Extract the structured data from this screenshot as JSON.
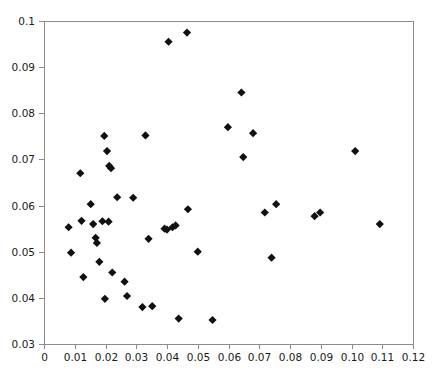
{
  "chart_data": {
    "type": "scatter",
    "title": "",
    "subtitle": "",
    "xlabel": "",
    "ylabel": "",
    "xlim": [
      0,
      0.12
    ],
    "ylim": [
      0.03,
      0.1
    ],
    "xticks": [
      0,
      0.01,
      0.02,
      0.03,
      0.04,
      0.05,
      0.06,
      0.07,
      0.08,
      0.09,
      0.1,
      0.11,
      0.12
    ],
    "xtick_labels": [
      "0",
      "0.01",
      "0.02",
      "0.03",
      "0.04",
      "0.05",
      "0.06",
      "0.07",
      "0.08",
      "0.09",
      "0.10",
      "0.11",
      "0.12"
    ],
    "yticks": [
      0.03,
      0.04,
      0.05,
      0.06,
      0.07,
      0.08,
      0.09,
      0.1
    ],
    "ytick_labels": [
      "0.03",
      "0.04",
      "0.05",
      "0.06",
      "0.07",
      "0.08",
      "0.09",
      "0.1"
    ],
    "grid": false,
    "legend": null,
    "marker_style": "diamond",
    "marker_color": "#111111",
    "marker_size": 7,
    "point_count": 48,
    "points": [
      [
        0.008,
        0.0553
      ],
      [
        0.0088,
        0.0498
      ],
      [
        0.0118,
        0.067
      ],
      [
        0.0122,
        0.0567
      ],
      [
        0.0128,
        0.0445
      ],
      [
        0.0152,
        0.0603
      ],
      [
        0.016,
        0.056
      ],
      [
        0.0168,
        0.053
      ],
      [
        0.0172,
        0.0519
      ],
      [
        0.018,
        0.0478
      ],
      [
        0.019,
        0.0566
      ],
      [
        0.0196,
        0.0751
      ],
      [
        0.0198,
        0.0398
      ],
      [
        0.0205,
        0.0718
      ],
      [
        0.021,
        0.0565
      ],
      [
        0.0212,
        0.0686
      ],
      [
        0.0218,
        0.0681
      ],
      [
        0.0222,
        0.0455
      ],
      [
        0.0238,
        0.0618
      ],
      [
        0.0262,
        0.0435
      ],
      [
        0.027,
        0.0404
      ],
      [
        0.029,
        0.0617
      ],
      [
        0.032,
        0.038
      ],
      [
        0.033,
        0.0752
      ],
      [
        0.034,
        0.0528
      ],
      [
        0.0352,
        0.0382
      ],
      [
        0.0392,
        0.055
      ],
      [
        0.04,
        0.0548
      ],
      [
        0.0405,
        0.0955
      ],
      [
        0.0418,
        0.0553
      ],
      [
        0.0428,
        0.0557
      ],
      [
        0.0438,
        0.0355
      ],
      [
        0.0465,
        0.0975
      ],
      [
        0.0468,
        0.0592
      ],
      [
        0.05,
        0.05
      ],
      [
        0.0548,
        0.0352
      ],
      [
        0.0598,
        0.077
      ],
      [
        0.0642,
        0.0845
      ],
      [
        0.0648,
        0.0705
      ],
      [
        0.068,
        0.0757
      ],
      [
        0.0718,
        0.0585
      ],
      [
        0.074,
        0.0487
      ],
      [
        0.0755,
        0.0603
      ],
      [
        0.088,
        0.0577
      ],
      [
        0.0898,
        0.0585
      ],
      [
        0.1012,
        0.0718
      ],
      [
        0.1092,
        0.056
      ]
    ]
  },
  "axes": {
    "plot_left_px": 44,
    "plot_right_px": 413,
    "plot_top_px": 21,
    "plot_bottom_px": 344
  }
}
